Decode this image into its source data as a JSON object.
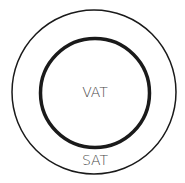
{
  "diagram": {
    "type": "concentric-circles",
    "outer": {
      "label": "SAT",
      "stroke_color": "#1a1a1a",
      "stroke_width": 1.5
    },
    "inner": {
      "label": "VAT",
      "stroke_color": "#1a1a1a",
      "stroke_width": 3.5
    },
    "label_color": "#4a4a4a",
    "background": "#ffffff"
  }
}
